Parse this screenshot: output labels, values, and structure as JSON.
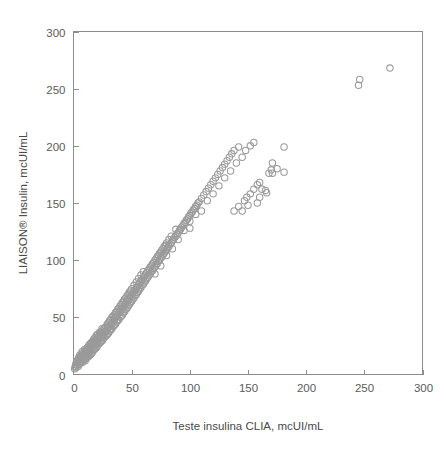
{
  "chart_data": {
    "type": "scatter",
    "title": "",
    "xlabel": "Teste insulina CLIA, mcUI/mL",
    "ylabel": "LIAISON® Insulin, mcUI/mL",
    "xlim": [
      0,
      300
    ],
    "ylim": [
      0,
      300
    ],
    "xticks": [
      0,
      50,
      100,
      150,
      200,
      250,
      300
    ],
    "yticks": [
      0,
      50,
      100,
      150,
      200,
      250,
      300
    ],
    "xtick_labels": [
      "0",
      "50",
      "100",
      "150",
      "200",
      "250",
      "300"
    ],
    "ytick_labels": [
      "0",
      "50",
      "100",
      "150",
      "200",
      "250",
      "300"
    ],
    "grid": false,
    "legend": null,
    "marker": "open-circle",
    "marker_color": "#9a9a9a",
    "marker_radius_px": 3.2,
    "frame": "box",
    "series": [
      {
        "name": "Insulin method comparison",
        "points": [
          [
            1,
            5
          ],
          [
            1.5,
            7
          ],
          [
            2,
            6
          ],
          [
            2,
            9
          ],
          [
            2.5,
            11
          ],
          [
            3,
            8
          ],
          [
            3,
            12
          ],
          [
            3.5,
            10
          ],
          [
            4,
            7
          ],
          [
            4,
            13
          ],
          [
            4.5,
            15
          ],
          [
            5,
            9
          ],
          [
            5,
            11
          ],
          [
            5,
            14
          ],
          [
            5.5,
            17
          ],
          [
            6,
            10
          ],
          [
            6,
            13
          ],
          [
            6.5,
            16
          ],
          [
            7,
            12
          ],
          [
            7,
            15
          ],
          [
            7,
            18
          ],
          [
            7.5,
            20
          ],
          [
            8,
            11
          ],
          [
            8,
            14
          ],
          [
            8.5,
            17
          ],
          [
            9,
            13
          ],
          [
            9,
            16
          ],
          [
            9,
            19
          ],
          [
            9.5,
            22
          ],
          [
            10,
            12
          ],
          [
            10,
            15
          ],
          [
            10,
            18
          ],
          [
            10.5,
            21
          ],
          [
            11,
            14
          ],
          [
            11,
            17
          ],
          [
            11,
            20
          ],
          [
            11.5,
            23
          ],
          [
            12,
            15
          ],
          [
            12,
            18
          ],
          [
            12,
            21
          ],
          [
            12.5,
            24
          ],
          [
            13,
            16
          ],
          [
            13,
            19
          ],
          [
            13,
            22
          ],
          [
            13.5,
            26
          ],
          [
            14,
            17
          ],
          [
            14,
            20
          ],
          [
            14,
            24
          ],
          [
            14.5,
            27
          ],
          [
            15,
            18
          ],
          [
            15,
            22
          ],
          [
            15,
            25
          ],
          [
            15.5,
            28
          ],
          [
            16,
            19
          ],
          [
            16,
            23
          ],
          [
            16,
            26
          ],
          [
            16.5,
            29
          ],
          [
            17,
            21
          ],
          [
            17,
            24
          ],
          [
            17,
            28
          ],
          [
            17.5,
            31
          ],
          [
            18,
            22
          ],
          [
            18,
            26
          ],
          [
            18,
            29
          ],
          [
            18.5,
            32
          ],
          [
            19,
            23
          ],
          [
            19,
            27
          ],
          [
            19,
            30
          ],
          [
            19.5,
            34
          ],
          [
            20,
            24
          ],
          [
            20,
            28
          ],
          [
            20,
            31
          ],
          [
            20.5,
            35
          ],
          [
            21,
            26
          ],
          [
            21,
            29
          ],
          [
            21,
            33
          ],
          [
            22,
            27
          ],
          [
            22,
            31
          ],
          [
            22,
            34
          ],
          [
            22.5,
            37
          ],
          [
            23,
            28
          ],
          [
            23,
            32
          ],
          [
            23,
            36
          ],
          [
            24,
            29
          ],
          [
            24,
            33
          ],
          [
            24,
            37
          ],
          [
            24.5,
            40
          ],
          [
            25,
            30
          ],
          [
            25,
            34
          ],
          [
            25,
            38
          ],
          [
            26,
            32
          ],
          [
            26,
            36
          ],
          [
            26,
            40
          ],
          [
            27,
            33
          ],
          [
            27,
            37
          ],
          [
            27,
            41
          ],
          [
            28,
            34
          ],
          [
            28,
            38
          ],
          [
            28,
            42
          ],
          [
            29,
            35
          ],
          [
            29,
            40
          ],
          [
            29,
            44
          ],
          [
            30,
            36
          ],
          [
            30,
            41
          ],
          [
            30,
            45
          ],
          [
            31,
            38
          ],
          [
            31,
            42
          ],
          [
            31,
            47
          ],
          [
            32,
            39
          ],
          [
            32,
            44
          ],
          [
            32,
            48
          ],
          [
            33,
            40
          ],
          [
            33,
            45
          ],
          [
            33,
            50
          ],
          [
            34,
            42
          ],
          [
            34,
            47
          ],
          [
            34,
            51
          ],
          [
            35,
            43
          ],
          [
            35,
            48
          ],
          [
            35,
            52
          ],
          [
            36,
            44
          ],
          [
            36,
            50
          ],
          [
            36,
            54
          ],
          [
            37,
            46
          ],
          [
            37,
            51
          ],
          [
            37,
            55
          ],
          [
            38,
            47
          ],
          [
            38,
            52
          ],
          [
            38,
            57
          ],
          [
            39,
            48
          ],
          [
            39,
            54
          ],
          [
            39,
            58
          ],
          [
            40,
            50
          ],
          [
            40,
            55
          ],
          [
            40,
            60
          ],
          [
            41,
            51
          ],
          [
            41,
            57
          ],
          [
            41,
            61
          ],
          [
            42,
            52
          ],
          [
            42,
            58
          ],
          [
            42,
            63
          ],
          [
            43,
            54
          ],
          [
            43,
            59
          ],
          [
            43,
            64
          ],
          [
            44,
            55
          ],
          [
            44,
            61
          ],
          [
            44,
            66
          ],
          [
            45,
            57
          ],
          [
            45,
            62
          ],
          [
            45,
            67
          ],
          [
            46,
            58
          ],
          [
            46,
            64
          ],
          [
            46,
            69
          ],
          [
            47,
            60
          ],
          [
            47,
            65
          ],
          [
            47,
            70
          ],
          [
            48,
            61
          ],
          [
            48,
            67
          ],
          [
            48,
            72
          ],
          [
            49,
            63
          ],
          [
            49,
            68
          ],
          [
            49,
            73
          ],
          [
            50,
            64
          ],
          [
            50,
            70
          ],
          [
            50,
            75
          ],
          [
            51,
            66
          ],
          [
            51,
            71
          ],
          [
            52,
            67
          ],
          [
            52,
            73
          ],
          [
            52,
            78
          ],
          [
            53,
            69
          ],
          [
            53,
            74
          ],
          [
            54,
            70
          ],
          [
            54,
            76
          ],
          [
            54,
            81
          ],
          [
            55,
            72
          ],
          [
            55,
            77
          ],
          [
            56,
            73
          ],
          [
            56,
            79
          ],
          [
            56,
            84
          ],
          [
            57,
            75
          ],
          [
            57,
            80
          ],
          [
            58,
            76
          ],
          [
            58,
            82
          ],
          [
            58,
            87
          ],
          [
            59,
            78
          ],
          [
            59,
            83
          ],
          [
            60,
            79
          ],
          [
            60,
            85
          ],
          [
            60,
            90
          ],
          [
            61,
            81
          ],
          [
            61,
            86
          ],
          [
            62,
            82
          ],
          [
            62,
            88
          ],
          [
            63,
            84
          ],
          [
            63,
            89
          ],
          [
            64,
            85
          ],
          [
            64,
            91
          ],
          [
            65,
            87
          ],
          [
            65,
            92
          ],
          [
            66,
            88
          ],
          [
            66,
            94
          ],
          [
            67,
            90
          ],
          [
            67,
            95
          ],
          [
            68,
            91
          ],
          [
            68,
            97
          ],
          [
            69,
            93
          ],
          [
            69,
            98
          ],
          [
            70,
            88
          ],
          [
            70,
            94
          ],
          [
            70,
            100
          ],
          [
            71,
            96
          ],
          [
            71,
            101
          ],
          [
            72,
            97
          ],
          [
            72,
            103
          ],
          [
            73,
            99
          ],
          [
            73,
            104
          ],
          [
            74,
            100
          ],
          [
            74,
            106
          ],
          [
            75,
            95
          ],
          [
            75,
            102
          ],
          [
            75,
            107
          ],
          [
            76,
            103
          ],
          [
            76,
            109
          ],
          [
            77,
            105
          ],
          [
            77,
            110
          ],
          [
            78,
            106
          ],
          [
            78,
            112
          ],
          [
            79,
            108
          ],
          [
            79,
            113
          ],
          [
            80,
            104
          ],
          [
            80,
            109
          ],
          [
            80,
            115
          ],
          [
            81,
            111
          ],
          [
            82,
            112
          ],
          [
            82,
            118
          ],
          [
            83,
            114
          ],
          [
            84,
            115
          ],
          [
            84,
            121
          ],
          [
            85,
            110
          ],
          [
            85,
            117
          ],
          [
            86,
            118
          ],
          [
            87,
            120
          ],
          [
            88,
            121
          ],
          [
            88,
            127
          ],
          [
            89,
            123
          ],
          [
            90,
            118
          ],
          [
            90,
            124
          ],
          [
            91,
            126
          ],
          [
            92,
            127
          ],
          [
            93,
            129
          ],
          [
            94,
            130
          ],
          [
            95,
            126
          ],
          [
            95,
            132
          ],
          [
            96,
            133
          ],
          [
            97,
            135
          ],
          [
            98,
            136
          ],
          [
            99,
            138
          ],
          [
            100,
            128
          ],
          [
            100,
            134
          ],
          [
            100,
            139
          ],
          [
            101,
            141
          ],
          [
            102,
            142
          ],
          [
            103,
            144
          ],
          [
            104,
            145
          ],
          [
            105,
            140
          ],
          [
            105,
            147
          ],
          [
            106,
            148
          ],
          [
            107,
            150
          ],
          [
            108,
            151
          ],
          [
            110,
            143
          ],
          [
            110,
            154
          ],
          [
            112,
            157
          ],
          [
            114,
            160
          ],
          [
            115,
            152
          ],
          [
            116,
            163
          ],
          [
            118,
            166
          ],
          [
            120,
            158
          ],
          [
            120,
            169
          ],
          [
            122,
            172
          ],
          [
            124,
            175
          ],
          [
            125,
            165
          ],
          [
            126,
            178
          ],
          [
            128,
            181
          ],
          [
            130,
            172
          ],
          [
            130,
            184
          ],
          [
            132,
            187
          ],
          [
            134,
            190
          ],
          [
            135,
            178
          ],
          [
            136,
            193
          ],
          [
            138,
            196
          ],
          [
            140,
            185
          ],
          [
            142,
            199
          ],
          [
            145,
            190
          ],
          [
            148,
            196
          ],
          [
            150,
            148
          ],
          [
            152,
            200
          ],
          [
            155,
            203
          ],
          [
            158,
            150
          ],
          [
            160,
            155
          ],
          [
            162,
            162
          ],
          [
            165,
            161
          ],
          [
            168,
            176
          ],
          [
            170,
            179
          ],
          [
            171,
            176
          ],
          [
            171,
            185
          ],
          [
            175,
            180
          ],
          [
            181,
            177
          ],
          [
            181,
            199
          ],
          [
            166,
            159
          ],
          [
            138,
            143
          ],
          [
            142,
            147
          ],
          [
            145,
            143
          ],
          [
            147,
            152
          ],
          [
            149,
            155
          ],
          [
            152,
            158
          ],
          [
            155,
            162
          ],
          [
            158,
            166
          ],
          [
            160,
            168
          ],
          [
            245,
            253
          ],
          [
            246,
            258
          ],
          [
            272,
            268
          ]
        ]
      }
    ]
  },
  "axes": {
    "x_label": "Teste insulina CLIA, mcUI/mL",
    "y_label": "LIAISON® Insulin, mcUI/mL",
    "x_ticks": [
      "0",
      "50",
      "100",
      "150",
      "200",
      "250",
      "300"
    ],
    "y_ticks": [
      "0",
      "50",
      "100",
      "150",
      "200",
      "250",
      "300"
    ]
  },
  "colors": {
    "marker_stroke": "#9a9a9a",
    "axis": "#8d8d8d",
    "text": "#5b5b5b",
    "background": "#ffffff"
  }
}
